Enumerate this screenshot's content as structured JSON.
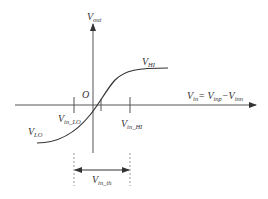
{
  "diagram": {
    "axes": {
      "y_label": {
        "main": "V",
        "sub": "out"
      },
      "x_label": {
        "parts": [
          {
            "main": "V",
            "sub": "in"
          },
          {
            "text": "= "
          },
          {
            "main": "V",
            "sub": "inp"
          },
          {
            "text": "−"
          },
          {
            "main": "V",
            "sub": "inn"
          }
        ]
      },
      "origin_label": "O"
    },
    "curve_labels": {
      "high": {
        "main": "V",
        "sub": "HI"
      },
      "low": {
        "main": "V",
        "sub": "LO"
      }
    },
    "tick_labels": {
      "in_lo": {
        "main": "V",
        "sub": "in_LO"
      },
      "in_hi": {
        "main": "V",
        "sub": "in_HI"
      }
    },
    "range_label": {
      "main": "V",
      "sub": "in_th"
    },
    "colors": {
      "line": "#333333",
      "axis": "#555555",
      "dash": "#999999"
    }
  }
}
